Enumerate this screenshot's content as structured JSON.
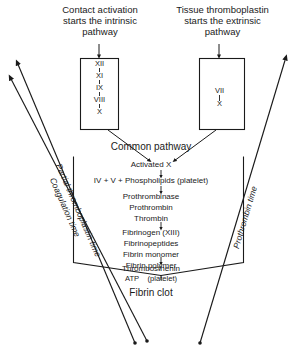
{
  "diagram": {
    "headers": {
      "intrinsic": "Contact activation\nstarts the intrinsic\npathway",
      "extrinsic": "Tissue thromboplastin\nstarts the extrinsic\npathway"
    },
    "intrinsic_box": {
      "name": "intrinsic pathway factors",
      "factors": [
        "XII",
        "XI",
        "IX",
        "VIII",
        "X"
      ]
    },
    "extrinsic_box": {
      "name": "extrinsic pathway factors",
      "factors": [
        "VII",
        "X"
      ]
    },
    "common_pathway": {
      "title": "Common pathway",
      "steps": [
        "Activated X",
        "IV + V + Phospholipids (platelet)",
        "Prothrombinase",
        "Prothrombin",
        "Thrombin",
        "Fibrinogen (XIII)",
        "Fibrinopeptides",
        "Fibrin monomer",
        "Fibrin polymer",
        "Thrombosthenin",
        "ATP    (platelet)"
      ]
    },
    "result": "Fibrin clot",
    "measurement_labels": {
      "left_outer": "Partial thromboplastin time",
      "left_inner": "Coagulation time",
      "right": "Prothrombin time"
    },
    "colors": {
      "ink": "#1a1a1a",
      "background": "#ffffff"
    }
  }
}
